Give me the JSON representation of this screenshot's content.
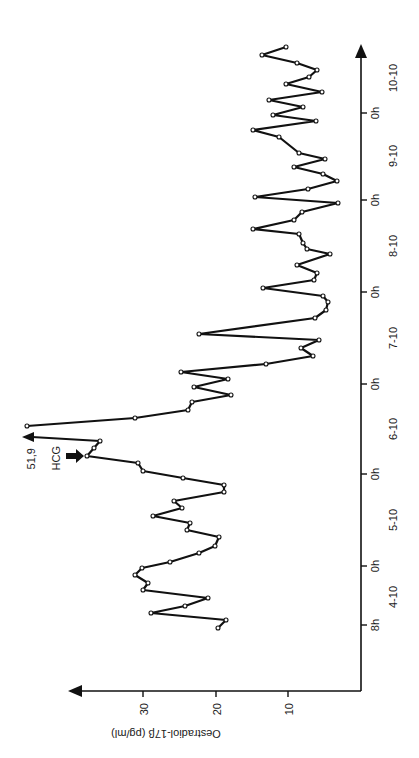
{
  "chart_data": {
    "type": "line",
    "title": "",
    "orientation": "rotated 90° counter-clockwise (time axis vertical, value axis horizontal)",
    "ylabel": "Oestradiol-17β (pg/ml)",
    "xlabel": "",
    "ylim": [
      0,
      40
    ],
    "y_ticks": [
      10,
      20,
      30
    ],
    "x_tick_labels": [
      "8h",
      "0h",
      "0h",
      "0h",
      "0h",
      "0h",
      "0h"
    ],
    "x_day_labels": [
      "4-10",
      "5-10",
      "6-10",
      "7-10",
      "8-10",
      "9-10",
      "10-10"
    ],
    "grid": false,
    "annotations": [
      {
        "text": "51,9",
        "meaning": "off-scale peak value (pg/ml)"
      },
      {
        "text": "HCG",
        "meaning": "time of HCG administration"
      }
    ],
    "series": [
      {
        "name": "Oestradiol-17β",
        "values": [
          19.7,
          18.6,
          29.0,
          24.3,
          21.1,
          30.1,
          29.4,
          31.2,
          30.2,
          26.3,
          22.3,
          20.1,
          19.6,
          24.0,
          23.6,
          28.7,
          24.7,
          25.8,
          18.9,
          18.9,
          24.6,
          30.1,
          30.8,
          37.8,
          36.8,
          36.0,
          51.9,
          31.2,
          23.9,
          23.3,
          17.9,
          23.0,
          18.3,
          24.8,
          13.1,
          6.6,
          8.3,
          5.8,
          22.3,
          6.3,
          4.8,
          4.5,
          5.2,
          13.5,
          6.5,
          6.1,
          8.8,
          4.3,
          7.4,
          8.0,
          8.6,
          14.9,
          9.2,
          8.1,
          3.2,
          14.6,
          7.3,
          3.3,
          5.2,
          9.2,
          5.0,
          8.6,
          11.3,
          14.9,
          6.2,
          12.1,
          8.0,
          12.7,
          5.4,
          10.3,
          7.2,
          6.1,
          8.8,
          13.7,
          10.3
        ]
      }
    ]
  },
  "labels": {
    "y_axis_title": "Oestradiol-17β (pg/ml)",
    "y_ticks": [
      "30",
      "20",
      "10"
    ],
    "x_hour_ticks": [
      "8h",
      "0h",
      "0h",
      "0h",
      "0h",
      "0h",
      "0h"
    ],
    "x_day_labels": [
      "4-10",
      "5-10",
      "6-10",
      "7-10",
      "8-10",
      "9-10",
      "10-10"
    ],
    "peak_label": "51,9",
    "hcg_label": "HCG"
  },
  "points_px": [
    [
      218,
      628
    ],
    [
      226,
      620
    ],
    [
      151,
      613
    ],
    [
      185,
      606
    ],
    [
      208,
      598
    ],
    [
      143,
      590
    ],
    [
      148,
      583
    ],
    [
      135,
      575
    ],
    [
      142,
      568
    ],
    [
      170,
      562
    ],
    [
      199,
      553
    ],
    [
      215,
      546
    ],
    [
      219,
      537
    ],
    [
      187,
      530
    ],
    [
      190,
      523
    ],
    [
      153,
      516
    ],
    [
      182,
      508
    ],
    [
      174,
      501
    ],
    [
      224,
      492
    ],
    [
      224,
      485
    ],
    [
      183,
      478
    ],
    [
      143,
      471
    ],
    [
      138,
      463
    ],
    [
      87,
      456
    ],
    [
      94,
      448
    ],
    [
      100,
      441
    ]
  ],
  "points_px_after_peak": [
    [
      27,
      426
    ],
    [
      135,
      418
    ],
    [
      188,
      410
    ],
    [
      192,
      402
    ],
    [
      231,
      395
    ],
    [
      194,
      387
    ],
    [
      228,
      379
    ],
    [
      181,
      372
    ],
    [
      266,
      364
    ],
    [
      313,
      356
    ],
    [
      301,
      348
    ],
    [
      319,
      340
    ],
    [
      199,
      334
    ],
    [
      315,
      318
    ],
    [
      326,
      310
    ],
    [
      328,
      302
    ],
    [
      323,
      296
    ],
    [
      263,
      288
    ],
    [
      314,
      280
    ],
    [
      317,
      273
    ],
    [
      297,
      265
    ],
    [
      330,
      254
    ],
    [
      307,
      249
    ],
    [
      303,
      243
    ],
    [
      299,
      234
    ],
    [
      253,
      229
    ],
    [
      294,
      220
    ],
    [
      302,
      212
    ],
    [
      338,
      203
    ],
    [
      255,
      197
    ],
    [
      308,
      189
    ],
    [
      337,
      181
    ],
    [
      323,
      174
    ],
    [
      294,
      167
    ],
    [
      325,
      159
    ],
    [
      299,
      153
    ],
    [
      279,
      137
    ],
    [
      253,
      130
    ],
    [
      316,
      121
    ],
    [
      273,
      115
    ],
    [
      303,
      107
    ],
    [
      269,
      100
    ],
    [
      322,
      92
    ],
    [
      286,
      84
    ],
    [
      309,
      77
    ],
    [
      317,
      70
    ],
    [
      297,
      63
    ],
    [
      262,
      55
    ],
    [
      286,
      47
    ]
  ]
}
